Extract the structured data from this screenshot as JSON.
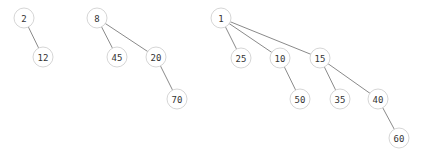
{
  "diagram": {
    "type": "forest",
    "node_radius": 10,
    "colors": {
      "edge": "#8a8a8a",
      "node_border": "#d6d6d6",
      "node_fill": "#ffffff",
      "text": "#333333"
    },
    "trees": [
      {
        "root": "2",
        "nodes": [
          {
            "id": "n2",
            "label": "2",
            "x": 24,
            "y": 18
          },
          {
            "id": "n12",
            "label": "12",
            "x": 43,
            "y": 57
          }
        ],
        "edges": [
          [
            "n2",
            "n12"
          ]
        ]
      },
      {
        "root": "8",
        "nodes": [
          {
            "id": "n8",
            "label": "8",
            "x": 97,
            "y": 18
          },
          {
            "id": "n45",
            "label": "45",
            "x": 117,
            "y": 57
          },
          {
            "id": "n20",
            "label": "20",
            "x": 156,
            "y": 57
          },
          {
            "id": "n70",
            "label": "70",
            "x": 177,
            "y": 99
          }
        ],
        "edges": [
          [
            "n8",
            "n45"
          ],
          [
            "n8",
            "n20"
          ],
          [
            "n20",
            "n70"
          ]
        ]
      },
      {
        "root": "1",
        "nodes": [
          {
            "id": "n1",
            "label": "1",
            "x": 221,
            "y": 18
          },
          {
            "id": "n25",
            "label": "25",
            "x": 241,
            "y": 58
          },
          {
            "id": "n10",
            "label": "10",
            "x": 280,
            "y": 58
          },
          {
            "id": "n15",
            "label": "15",
            "x": 320,
            "y": 58
          },
          {
            "id": "n50",
            "label": "50",
            "x": 300,
            "y": 99
          },
          {
            "id": "n35",
            "label": "35",
            "x": 340,
            "y": 99
          },
          {
            "id": "n40",
            "label": "40",
            "x": 378,
            "y": 99
          },
          {
            "id": "n60",
            "label": "60",
            "x": 399,
            "y": 138
          }
        ],
        "edges": [
          [
            "n1",
            "n25"
          ],
          [
            "n1",
            "n10"
          ],
          [
            "n1",
            "n15"
          ],
          [
            "n10",
            "n50"
          ],
          [
            "n15",
            "n35"
          ],
          [
            "n15",
            "n40"
          ],
          [
            "n40",
            "n60"
          ]
        ]
      }
    ]
  }
}
